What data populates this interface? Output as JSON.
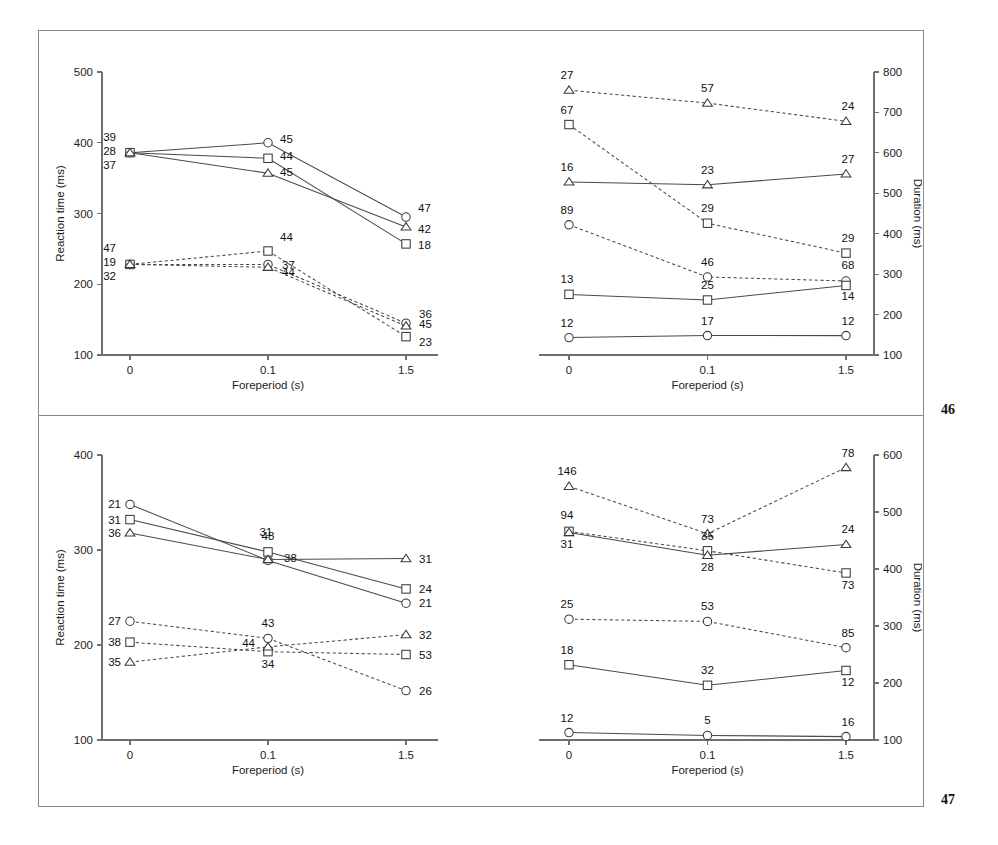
{
  "figure": {
    "panels": [
      {
        "id": "panel-a",
        "number": "46",
        "charts": [
          {
            "id": "a-left",
            "xlabel": "Foreperiod (s)",
            "ylabel": "Reaction time (ms)",
            "xticklabels": [
              "0",
              "0.1",
              "1.5"
            ],
            "yticklabels": [
              "100",
              "200",
              "300",
              "400",
              "500"
            ]
          },
          {
            "id": "a-right",
            "xlabel": "Foreperiod (s)",
            "ylabel": "Duration (ms)",
            "xticklabels": [
              "0",
              "0.1",
              "1.5"
            ],
            "yticklabels": [
              "100",
              "200",
              "300",
              "400",
              "500",
              "600",
              "700",
              "800"
            ]
          }
        ]
      },
      {
        "id": "panel-b",
        "number": "47",
        "charts": [
          {
            "id": "b-left",
            "xlabel": "Foreperiod (s)",
            "ylabel": "Reaction time (ms)",
            "xticklabels": [
              "0",
              "0.1",
              "1.5"
            ],
            "yticklabels": [
              "100",
              "200",
              "300",
              "400"
            ]
          },
          {
            "id": "b-right",
            "xlabel": "Foreperiod (s)",
            "ylabel": "Duration (ms)",
            "xticklabels": [
              "0",
              "0.1",
              "1.5"
            ],
            "yticklabels": [
              "100",
              "200",
              "300",
              "400",
              "500",
              "600"
            ]
          }
        ]
      }
    ]
  },
  "chart_data": [
    {
      "id": "a-left",
      "type": "line",
      "title": "",
      "xlabel": "Foreperiod (s)",
      "ylabel": "Reaction time (ms)",
      "x": [
        0,
        0.1,
        1.5
      ],
      "xticklabels": [
        "0",
        "0.1",
        "1.5"
      ],
      "ylim": [
        100,
        500
      ],
      "yticks": [
        100,
        200,
        300,
        400,
        500
      ],
      "grid": false,
      "legend": "none",
      "series": [
        {
          "name": "circle-solid",
          "marker": "circle",
          "linestyle": "solid",
          "values": [
            386,
            400,
            295
          ],
          "point_labels": [
            "39",
            "45",
            "47"
          ]
        },
        {
          "name": "square-solid",
          "marker": "square",
          "linestyle": "solid",
          "values": [
            386,
            378,
            257
          ],
          "point_labels": [
            "28",
            "44",
            "18"
          ]
        },
        {
          "name": "triangle-solid",
          "marker": "triangle",
          "linestyle": "solid",
          "values": [
            386,
            357,
            281
          ],
          "point_labels": [
            "37",
            "45",
            "42"
          ]
        },
        {
          "name": "circle-dashed",
          "marker": "circle",
          "linestyle": "dashed",
          "values": [
            228,
            228,
            145
          ],
          "point_labels": [
            "47",
            "44",
            "36"
          ]
        },
        {
          "name": "square-dashed",
          "marker": "square",
          "linestyle": "dashed",
          "values": [
            228,
            247,
            126
          ],
          "point_labels": [
            "19",
            "44",
            "23"
          ]
        },
        {
          "name": "triangle-dashed",
          "marker": "triangle",
          "linestyle": "dashed",
          "values": [
            228,
            224,
            141
          ],
          "point_labels": [
            "32",
            "37",
            "45"
          ]
        }
      ]
    },
    {
      "id": "a-right",
      "type": "line",
      "title": "",
      "xlabel": "Foreperiod (s)",
      "ylabel": "Duration (ms)",
      "x": [
        0,
        0.1,
        1.5
      ],
      "xticklabels": [
        "0",
        "0.1",
        "1.5"
      ],
      "ylim": [
        100,
        800
      ],
      "yticks": [
        100,
        200,
        300,
        400,
        500,
        600,
        700,
        800
      ],
      "grid": false,
      "legend": "none",
      "series": [
        {
          "name": "triangle-dashed",
          "marker": "triangle",
          "linestyle": "dashed",
          "values": [
            755,
            723,
            678
          ],
          "point_labels": [
            "27",
            "57",
            "24"
          ]
        },
        {
          "name": "square-dashed",
          "marker": "square",
          "linestyle": "dashed",
          "values": [
            670,
            426,
            352
          ],
          "point_labels": [
            "67",
            "29",
            "29"
          ]
        },
        {
          "name": "triangle-solid",
          "marker": "triangle",
          "linestyle": "solid",
          "values": [
            528,
            521,
            548
          ],
          "point_labels": [
            "16",
            "23",
            "27"
          ]
        },
        {
          "name": "circle-dashed",
          "marker": "circle",
          "linestyle": "dashed",
          "values": [
            422,
            293,
            283
          ],
          "point_labels": [
            "89",
            "46",
            "68"
          ]
        },
        {
          "name": "square-solid",
          "marker": "square",
          "linestyle": "solid",
          "values": [
            250,
            236,
            272
          ],
          "point_labels": [
            "13",
            "25",
            "14"
          ]
        },
        {
          "name": "circle-solid",
          "marker": "circle",
          "linestyle": "solid",
          "values": [
            143,
            148,
            148
          ],
          "point_labels": [
            "12",
            "17",
            "12"
          ]
        }
      ]
    },
    {
      "id": "b-left",
      "type": "line",
      "title": "",
      "xlabel": "Foreperiod (s)",
      "ylabel": "Reaction time (ms)",
      "x": [
        0,
        0.1,
        1.5
      ],
      "xticklabels": [
        "0",
        "0.1",
        "1.5"
      ],
      "ylim": [
        100,
        400
      ],
      "yticks": [
        100,
        200,
        300,
        400
      ],
      "grid": false,
      "legend": "none",
      "series": [
        {
          "name": "circle-solid",
          "marker": "circle",
          "linestyle": "solid",
          "values": [
            348,
            289,
            244
          ],
          "point_labels": [
            "21",
            "31",
            "21"
          ]
        },
        {
          "name": "square-solid",
          "marker": "square",
          "linestyle": "solid",
          "values": [
            332,
            298,
            259
          ],
          "point_labels": [
            "31",
            "48",
            "24"
          ]
        },
        {
          "name": "triangle-solid",
          "marker": "triangle",
          "linestyle": "solid",
          "values": [
            318,
            290,
            291
          ],
          "point_labels": [
            "36",
            "38",
            "31"
          ]
        },
        {
          "name": "circle-dashed",
          "marker": "circle",
          "linestyle": "dashed",
          "values": [
            225,
            207,
            152
          ],
          "point_labels": [
            "27",
            "43",
            "26"
          ]
        },
        {
          "name": "square-dashed",
          "marker": "square",
          "linestyle": "dashed",
          "values": [
            203,
            193,
            190
          ],
          "point_labels": [
            "38",
            "34",
            "53"
          ]
        },
        {
          "name": "triangle-dashed",
          "marker": "triangle",
          "linestyle": "dashed",
          "values": [
            182,
            198,
            211
          ],
          "point_labels": [
            "35",
            "44",
            "32"
          ]
        }
      ]
    },
    {
      "id": "b-right",
      "type": "line",
      "title": "",
      "xlabel": "Foreperiod (s)",
      "ylabel": "Duration (ms)",
      "x": [
        0,
        0.1,
        1.5
      ],
      "xticklabels": [
        "0",
        "0.1",
        "1.5"
      ],
      "ylim": [
        100,
        600
      ],
      "yticks": [
        100,
        200,
        300,
        400,
        500,
        600
      ],
      "grid": false,
      "legend": "none",
      "series": [
        {
          "name": "triangle-dashed",
          "marker": "triangle",
          "linestyle": "dashed",
          "values": [
            545,
            462,
            578
          ],
          "point_labels": [
            "146",
            "73",
            "78"
          ]
        },
        {
          "name": "square-dashed",
          "marker": "square",
          "linestyle": "dashed",
          "values": [
            466,
            432,
            393
          ],
          "point_labels": [
            "94",
            "35",
            "73"
          ]
        },
        {
          "name": "triangle-solid",
          "marker": "triangle",
          "linestyle": "solid",
          "values": [
            464,
            424,
            443
          ],
          "point_labels": [
            "31",
            "28",
            "24"
          ]
        },
        {
          "name": "circle-dashed",
          "marker": "circle",
          "linestyle": "dashed",
          "values": [
            312,
            308,
            262
          ],
          "point_labels": [
            "25",
            "53",
            "85"
          ]
        },
        {
          "name": "square-solid",
          "marker": "square",
          "linestyle": "solid",
          "values": [
            232,
            196,
            222
          ],
          "point_labels": [
            "18",
            "32",
            "12"
          ]
        },
        {
          "name": "circle-solid",
          "marker": "circle",
          "linestyle": "solid",
          "values": [
            113,
            108,
            106
          ],
          "point_labels": [
            "12",
            "5",
            "16"
          ]
        }
      ]
    }
  ]
}
